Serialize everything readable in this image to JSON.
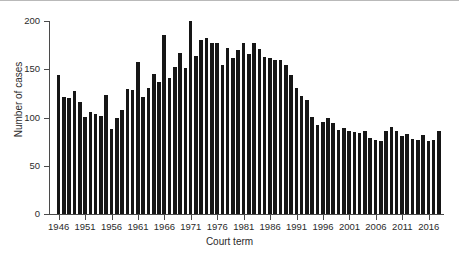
{
  "chart_data": {
    "type": "bar",
    "title": "",
    "xlabel": "Court term",
    "ylabel": "Number of cases",
    "ylim": [
      0,
      200
    ],
    "yticks": [
      0,
      50,
      100,
      150,
      200
    ],
    "ytick_labels": [
      "0",
      "50",
      "100",
      "150",
      "200"
    ],
    "grid": false,
    "legend": null,
    "xtick_labels": [
      "1946",
      "1951",
      "1956",
      "1961",
      "1966",
      "1971",
      "1976",
      "1981",
      "1986",
      "1991",
      "1996",
      "2001",
      "2006",
      "2011",
      "2016"
    ],
    "xtick_years": [
      1946,
      1951,
      1956,
      1961,
      1966,
      1971,
      1976,
      1981,
      1986,
      1991,
      1996,
      2001,
      2006,
      2011,
      2016
    ],
    "x_start_year": 1946,
    "x_end_year": 2018,
    "categories": [
      "1946",
      "1947",
      "1948",
      "1949",
      "1950",
      "1951",
      "1952",
      "1953",
      "1954",
      "1955",
      "1956",
      "1957",
      "1958",
      "1959",
      "1960",
      "1961",
      "1962",
      "1963",
      "1964",
      "1965",
      "1966",
      "1967",
      "1968",
      "1969",
      "1970",
      "1971",
      "1972",
      "1973",
      "1974",
      "1975",
      "1976",
      "1977",
      "1978",
      "1979",
      "1980",
      "1981",
      "1982",
      "1983",
      "1984",
      "1985",
      "1986",
      "1987",
      "1988",
      "1989",
      "1990",
      "1991",
      "1992",
      "1993",
      "1994",
      "1995",
      "1996",
      "1997",
      "1998",
      "1999",
      "2000",
      "2001",
      "2002",
      "2003",
      "2004",
      "2005",
      "2006",
      "2007",
      "2008",
      "2009",
      "2010",
      "2011",
      "2012",
      "2013",
      "2014",
      "2015",
      "2016",
      "2017",
      "2018"
    ],
    "values": [
      142,
      119,
      118,
      126,
      114,
      99,
      104,
      102,
      100,
      121,
      87,
      98,
      106,
      128,
      127,
      155,
      119,
      129,
      143,
      135,
      183,
      139,
      150,
      164,
      149,
      197,
      161,
      178,
      180,
      174,
      175,
      152,
      169,
      159,
      167,
      174,
      163,
      174,
      168,
      160,
      159,
      157,
      157,
      152,
      142,
      129,
      120,
      116,
      99,
      91,
      94,
      98,
      93,
      86,
      88,
      85,
      84,
      83,
      85,
      78,
      76,
      75,
      85,
      89,
      85,
      80,
      82,
      77,
      76,
      81,
      75,
      76,
      85
    ],
    "caption": ""
  }
}
